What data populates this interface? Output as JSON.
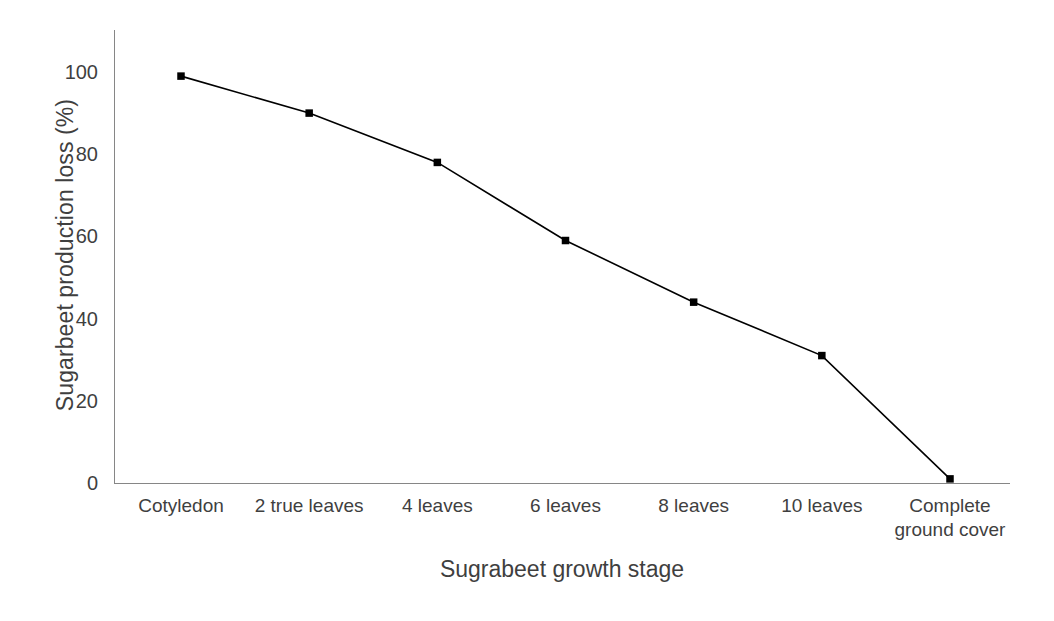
{
  "chart_data": {
    "type": "line",
    "title": "",
    "xlabel": "Sugrabeet growth stage",
    "ylabel": "Sugarbeet production loss (%)",
    "categories": [
      "Cotyledon",
      "2 true leaves",
      "4 leaves",
      "6 leaves",
      "8 leaves",
      "10 leaves",
      "Complete\nground cover"
    ],
    "values": [
      99,
      90,
      78,
      59,
      44,
      31,
      1
    ],
    "ylim": [
      0,
      100
    ],
    "yticks": [
      0,
      20,
      40,
      60,
      80,
      100
    ],
    "ytick_labels": [
      "0",
      "20",
      "40",
      "60",
      "80",
      "100"
    ],
    "grid": false,
    "legend": false,
    "legend_position": "none",
    "series": [
      {
        "name": "Sugarbeet production loss",
        "values": [
          99,
          90,
          78,
          59,
          44,
          31,
          1
        ],
        "line_color": "#000000",
        "marker": "square",
        "marker_color": "#000000"
      }
    ],
    "axis_color": "#868686",
    "text_color": "#3f3f3f"
  }
}
